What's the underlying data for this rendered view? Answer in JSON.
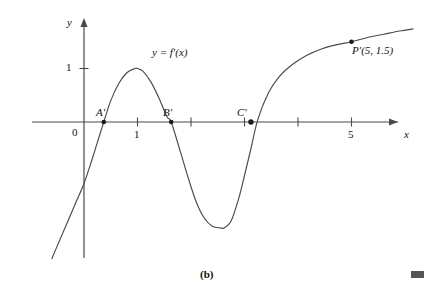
{
  "figure": {
    "caption": "(b)",
    "curve_label": "y = f′(x)",
    "background_color": "#ffffff",
    "ink_color": "#3a3a3a",
    "text_color": "#111111"
  },
  "axes": {
    "x_axis_name": "x",
    "y_axis_name": "y",
    "origin_label": "0",
    "x_ticks": [
      {
        "value": 1,
        "label": "1"
      },
      {
        "value": 2,
        "label": ""
      },
      {
        "value": 3,
        "label": ""
      },
      {
        "value": 4,
        "label": ""
      },
      {
        "value": 5,
        "label": "5"
      }
    ],
    "y_ticks": [
      {
        "value": 1,
        "label": "1"
      }
    ]
  },
  "points": [
    {
      "name": "A-prime",
      "label": "A′",
      "x": 0.37,
      "y": 0
    },
    {
      "name": "B-prime",
      "label": "B′",
      "x": 1.63,
      "y": 0
    },
    {
      "name": "C-prime",
      "label": "C′",
      "x": 3.12,
      "y": 0
    },
    {
      "name": "P-prime",
      "label": "P′(5, 1.5)",
      "x": 5,
      "y": 1.5
    }
  ],
  "chart_data": {
    "type": "line",
    "title": "(b)",
    "xlabel": "x",
    "ylabel": "y",
    "xlim": [
      -0.55,
      6.4
    ],
    "ylim": [
      -2.6,
      1.85
    ],
    "grid": false,
    "legend": "none",
    "series": [
      {
        "name": "y = f'(x)",
        "x": [
          -0.6,
          -0.45,
          -0.3,
          -0.15,
          0.0,
          0.15,
          0.3,
          0.37,
          0.5,
          0.65,
          0.8,
          0.95,
          1.0,
          1.1,
          1.25,
          1.4,
          1.55,
          1.63,
          1.8,
          1.95,
          2.1,
          2.25,
          2.4,
          2.55,
          2.62,
          2.75,
          2.9,
          3.0,
          3.12,
          3.25,
          3.45,
          3.65,
          3.9,
          4.15,
          4.45,
          4.75,
          5.0,
          5.3,
          5.6,
          5.9,
          6.15
        ],
        "y": [
          -2.55,
          -2.2,
          -1.85,
          -1.5,
          -1.15,
          -0.7,
          -0.22,
          0.0,
          0.4,
          0.72,
          0.92,
          1.0,
          1.0,
          0.95,
          0.75,
          0.45,
          0.1,
          0.0,
          -0.55,
          -1.05,
          -1.5,
          -1.8,
          -1.95,
          -1.98,
          -1.98,
          -1.85,
          -1.4,
          -1.0,
          -0.5,
          0.05,
          0.55,
          0.85,
          1.08,
          1.24,
          1.37,
          1.45,
          1.5,
          1.58,
          1.64,
          1.7,
          1.74
        ]
      }
    ],
    "annotations": [
      {
        "text": "y = f′(x)",
        "x": 1.55,
        "y": 1.02
      },
      {
        "text": "A′",
        "x": 0.33,
        "y": 0.26
      },
      {
        "text": "B′",
        "x": 1.6,
        "y": 0.26
      },
      {
        "text": "C′",
        "x": 3.06,
        "y": 0.26
      },
      {
        "text": "P′(5, 1.5)",
        "x": 5.1,
        "y": 1.35
      }
    ]
  }
}
